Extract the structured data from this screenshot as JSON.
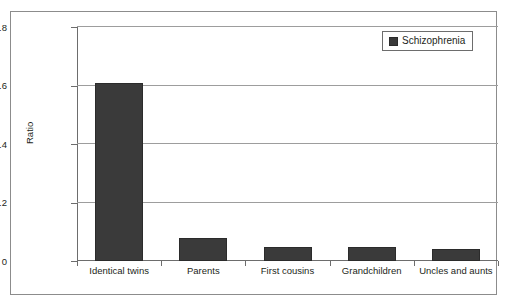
{
  "chart_data": {
    "type": "bar",
    "title": "",
    "subtitle": "",
    "xlabel": "",
    "ylabel": "Ratio",
    "categories": [
      "Identical twins",
      "Parents",
      "First cousins",
      "Grandchildren",
      "Uncles and aunts"
    ],
    "series": [
      {
        "name": "Schizophrenia",
        "color": "#3a3a3a",
        "values": [
          0.607,
          0.08,
          0.047,
          0.048,
          0.04
        ]
      }
    ],
    "ylim": [
      0,
      0.8
    ],
    "yticks": [
      0,
      0.2,
      0.4,
      0.6,
      0.8
    ],
    "ytick_labels": [
      "0",
      "0.2",
      "0.4",
      "0.6",
      "0.8"
    ],
    "grid": true,
    "grid_axis": "y",
    "legend": {
      "position": "top-right",
      "entries": [
        {
          "label": "Schizophrenia",
          "color": "#3a3a3a"
        }
      ]
    }
  },
  "figure": {
    "border_color": "#8c8c8c",
    "background": "#ffffff",
    "axis_color": "#6d6d6d",
    "gridline_color": "#9d9d9d",
    "text_color": "#231f20"
  }
}
